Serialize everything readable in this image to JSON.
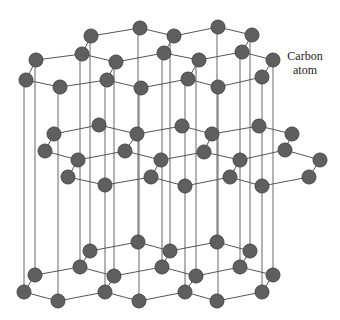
{
  "diagram": {
    "label": {
      "line1": "Carbon",
      "line2": "atom"
    },
    "colors": {
      "atom_fill": "#5f5f5f",
      "atom_stroke": "#474747",
      "bond": "#555555",
      "interlayer_line": "#666666"
    },
    "atom_radius": 7,
    "layers": [
      {
        "name": "top",
        "atoms": [
          [
            140,
            28
          ],
          [
            218,
            27
          ],
          [
            91,
            36
          ],
          [
            174,
            36
          ],
          [
            252,
            35
          ],
          [
            82,
            54
          ],
          [
            164,
            53
          ],
          [
            242,
            52
          ],
          [
            36,
            60
          ],
          [
            116,
            62
          ],
          [
            199,
            60
          ],
          [
            273,
            60
          ],
          [
            26,
            80
          ],
          [
            107,
            80
          ],
          [
            188,
            79
          ],
          [
            262,
            77
          ],
          [
            60,
            87
          ],
          [
            141,
            88
          ],
          [
            218,
            87
          ]
        ],
        "bonds": [
          [
            140,
            28,
            91,
            36
          ],
          [
            140,
            28,
            174,
            36
          ],
          [
            218,
            27,
            174,
            36
          ],
          [
            218,
            27,
            252,
            35
          ],
          [
            91,
            36,
            82,
            54
          ],
          [
            174,
            36,
            164,
            53
          ],
          [
            252,
            35,
            242,
            52
          ],
          [
            82,
            54,
            36,
            60
          ],
          [
            82,
            54,
            116,
            62
          ],
          [
            164,
            53,
            116,
            62
          ],
          [
            164,
            53,
            199,
            60
          ],
          [
            242,
            52,
            199,
            60
          ],
          [
            242,
            52,
            273,
            60
          ],
          [
            36,
            60,
            26,
            80
          ],
          [
            116,
            62,
            107,
            80
          ],
          [
            199,
            60,
            188,
            79
          ],
          [
            273,
            60,
            262,
            77
          ],
          [
            26,
            80,
            60,
            87
          ],
          [
            60,
            87,
            107,
            80
          ],
          [
            107,
            80,
            141,
            88
          ],
          [
            141,
            88,
            188,
            79
          ],
          [
            188,
            79,
            218,
            87
          ],
          [
            218,
            87,
            262,
            77
          ]
        ]
      },
      {
        "name": "middle",
        "atoms": [
          [
            99,
            125
          ],
          [
            182,
            126
          ],
          [
            259,
            126
          ],
          [
            54,
            134
          ],
          [
            137,
            134
          ],
          [
            212,
            134
          ],
          [
            292,
            134
          ],
          [
            45,
            151
          ],
          [
            125,
            151
          ],
          [
            204,
            152
          ],
          [
            285,
            150
          ],
          [
            78,
            160
          ],
          [
            161,
            160
          ],
          [
            240,
            160
          ],
          [
            320,
            160
          ],
          [
            68,
            177
          ],
          [
            151,
            177
          ],
          [
            230,
            177
          ],
          [
            309,
            177
          ],
          [
            105,
            185
          ],
          [
            185,
            186
          ],
          [
            262,
            186
          ]
        ],
        "bonds": [
          [
            99,
            125,
            54,
            134
          ],
          [
            99,
            125,
            137,
            134
          ],
          [
            182,
            126,
            137,
            134
          ],
          [
            182,
            126,
            212,
            134
          ],
          [
            259,
            126,
            212,
            134
          ],
          [
            259,
            126,
            292,
            134
          ],
          [
            54,
            134,
            45,
            151
          ],
          [
            137,
            134,
            125,
            151
          ],
          [
            212,
            134,
            204,
            152
          ],
          [
            292,
            134,
            285,
            150
          ],
          [
            45,
            151,
            78,
            160
          ],
          [
            78,
            160,
            125,
            151
          ],
          [
            125,
            151,
            161,
            160
          ],
          [
            161,
            160,
            204,
            152
          ],
          [
            204,
            152,
            240,
            160
          ],
          [
            240,
            160,
            285,
            150
          ],
          [
            285,
            150,
            320,
            160
          ],
          [
            78,
            160,
            68,
            177
          ],
          [
            161,
            160,
            151,
            177
          ],
          [
            240,
            160,
            230,
            177
          ],
          [
            320,
            160,
            309,
            177
          ],
          [
            68,
            177,
            105,
            185
          ],
          [
            105,
            185,
            151,
            177
          ],
          [
            151,
            177,
            185,
            186
          ],
          [
            185,
            186,
            230,
            177
          ],
          [
            230,
            177,
            262,
            186
          ],
          [
            262,
            186,
            309,
            177
          ]
        ]
      },
      {
        "name": "bottom",
        "atoms": [
          [
            138,
            242
          ],
          [
            217,
            242
          ],
          [
            90,
            251
          ],
          [
            170,
            251
          ],
          [
            250,
            251
          ],
          [
            80,
            267
          ],
          [
            162,
            267
          ],
          [
            240,
            267
          ],
          [
            35,
            275
          ],
          [
            114,
            276
          ],
          [
            196,
            276
          ],
          [
            273,
            275
          ],
          [
            24,
            292
          ],
          [
            105,
            292
          ],
          [
            185,
            292
          ],
          [
            262,
            292
          ],
          [
            58,
            301
          ],
          [
            139,
            301
          ],
          [
            217,
            301
          ]
        ],
        "bonds": [
          [
            138,
            242,
            90,
            251
          ],
          [
            138,
            242,
            170,
            251
          ],
          [
            217,
            242,
            170,
            251
          ],
          [
            217,
            242,
            250,
            251
          ],
          [
            90,
            251,
            80,
            267
          ],
          [
            170,
            251,
            162,
            267
          ],
          [
            250,
            251,
            240,
            267
          ],
          [
            80,
            267,
            35,
            275
          ],
          [
            80,
            267,
            114,
            276
          ],
          [
            162,
            267,
            114,
            276
          ],
          [
            162,
            267,
            196,
            276
          ],
          [
            240,
            267,
            196,
            276
          ],
          [
            240,
            267,
            273,
            275
          ],
          [
            35,
            275,
            24,
            292
          ],
          [
            114,
            276,
            105,
            292
          ],
          [
            196,
            276,
            185,
            292
          ],
          [
            273,
            275,
            262,
            292
          ],
          [
            24,
            292,
            58,
            301
          ],
          [
            58,
            301,
            105,
            292
          ],
          [
            105,
            292,
            139,
            301
          ],
          [
            139,
            301,
            185,
            292
          ],
          [
            185,
            292,
            217,
            301
          ],
          [
            217,
            301,
            262,
            292
          ]
        ]
      }
    ],
    "interlayer_lines": [
      [
        24,
        80,
        24,
        292
      ],
      [
        35,
        60,
        35,
        275
      ],
      [
        58,
        87,
        58,
        301
      ],
      [
        80,
        54,
        80,
        267
      ],
      [
        90,
        36,
        90,
        251
      ],
      [
        105,
        80,
        105,
        292
      ],
      [
        114,
        62,
        114,
        276
      ],
      [
        138,
        28,
        138,
        242
      ],
      [
        139,
        88,
        139,
        301
      ],
      [
        162,
        53,
        162,
        267
      ],
      [
        170,
        36,
        170,
        251
      ],
      [
        185,
        79,
        185,
        292
      ],
      [
        196,
        60,
        196,
        276
      ],
      [
        217,
        27,
        217,
        242
      ],
      [
        218,
        87,
        218,
        301
      ],
      [
        240,
        52,
        240,
        267
      ],
      [
        250,
        35,
        250,
        251
      ],
      [
        262,
        77,
        262,
        292
      ],
      [
        273,
        60,
        273,
        275
      ]
    ]
  }
}
